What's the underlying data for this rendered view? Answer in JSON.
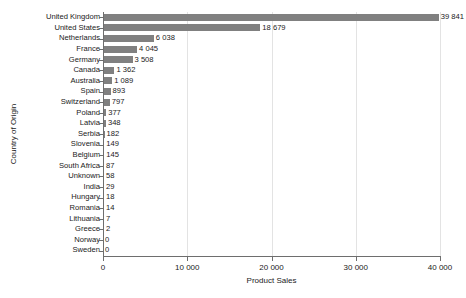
{
  "chart_data": {
    "type": "bar",
    "orientation": "horizontal",
    "title": "",
    "xlabel": "Product Sales",
    "ylabel": "Country of Origin",
    "xlim": [
      0,
      40000
    ],
    "xticks": [
      0,
      10000,
      20000,
      30000,
      40000
    ],
    "xtick_labels": [
      "0",
      "10 000",
      "20 000",
      "30 000",
      "40 000"
    ],
    "grid": "vertical",
    "legend": "none",
    "bar_color": "#808080",
    "categories": [
      "United Kingdom",
      "United States",
      "Netherlands",
      "France",
      "Germany",
      "Canada",
      "Australia",
      "Spain",
      "Switzerland",
      "Poland",
      "Latvia",
      "Serbia",
      "Slovenia",
      "Belgium",
      "South Africa",
      "Unknown",
      "India",
      "Hungary",
      "Romania",
      "Lithuania",
      "Greece",
      "Norway",
      "Sweden"
    ],
    "values": [
      39841,
      18679,
      6038,
      4045,
      3508,
      1362,
      1089,
      893,
      797,
      377,
      348,
      182,
      149,
      145,
      87,
      58,
      29,
      18,
      14,
      7,
      2,
      0,
      0
    ],
    "value_labels": [
      "39 841",
      "18 679",
      "6 038",
      "4 045",
      "3 508",
      "1 362",
      "1 089",
      "893",
      "797",
      "377",
      "348",
      "182",
      "149",
      "145",
      "87",
      "58",
      "29",
      "18",
      "14",
      "7",
      "2",
      "0",
      "0"
    ]
  }
}
